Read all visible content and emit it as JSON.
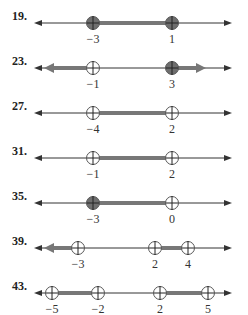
{
  "problems": [
    {
      "number": "19.",
      "points": [
        {
          "x": 93,
          "label": "−3",
          "filled": true
        },
        {
          "x": 172,
          "label": "1",
          "filled": true
        }
      ],
      "segments": [
        [
          93,
          172
        ]
      ],
      "rays_left": [],
      "rays_right": []
    },
    {
      "number": "23.",
      "points": [
        {
          "x": 93,
          "label": "−1",
          "filled": false
        },
        {
          "x": 172,
          "label": "3",
          "filled": true
        }
      ],
      "segments": [],
      "rays_left": [
        93
      ],
      "rays_right": [
        172
      ]
    },
    {
      "number": "27.",
      "points": [
        {
          "x": 93,
          "label": "−4",
          "filled": false
        },
        {
          "x": 172,
          "label": "2",
          "filled": false
        }
      ],
      "segments": [
        [
          93,
          172
        ]
      ],
      "rays_left": [],
      "rays_right": []
    },
    {
      "number": "31.",
      "points": [
        {
          "x": 93,
          "label": "−1",
          "filled": false
        },
        {
          "x": 172,
          "label": "2",
          "filled": false
        }
      ],
      "segments": [
        [
          93,
          172
        ]
      ],
      "rays_left": [],
      "rays_right": []
    },
    {
      "number": "35.",
      "points": [
        {
          "x": 93,
          "label": "−3",
          "filled": true
        },
        {
          "x": 172,
          "label": "0",
          "filled": false
        }
      ],
      "segments": [
        [
          93,
          172
        ]
      ],
      "rays_left": [],
      "rays_right": []
    },
    {
      "number": "39.",
      "points": [
        {
          "x": 78,
          "label": "−3",
          "filled": false
        },
        {
          "x": 155,
          "label": "2",
          "filled": false
        },
        {
          "x": 188,
          "label": "4",
          "filled": false
        }
      ],
      "segments": [
        [
          155,
          188
        ]
      ],
      "rays_left": [
        78
      ],
      "rays_right": []
    },
    {
      "number": "43.",
      "points": [
        {
          "x": 52,
          "label": "−5",
          "filled": false
        },
        {
          "x": 98,
          "label": "−2",
          "filled": false
        },
        {
          "x": 160,
          "label": "2",
          "filled": false
        },
        {
          "x": 208,
          "label": "5",
          "filled": false
        }
      ],
      "segments": [
        [
          52,
          98
        ],
        [
          160,
          208
        ]
      ],
      "rays_left": [],
      "rays_right": []
    }
  ],
  "colors": {
    "line": "#333333",
    "shade": "#777777",
    "fill": "#6e6e6e"
  }
}
